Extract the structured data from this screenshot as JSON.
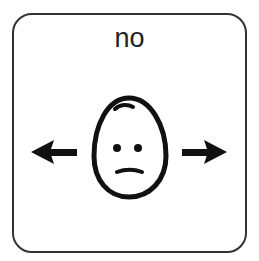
{
  "card": {
    "label": "no",
    "symbol": "face-neutral-with-side-arrows",
    "icons": [
      "arrow-left-icon",
      "face-icon",
      "arrow-right-icon"
    ],
    "colors": {
      "border": "#333333",
      "ink": "#111111",
      "background": "#ffffff"
    }
  }
}
